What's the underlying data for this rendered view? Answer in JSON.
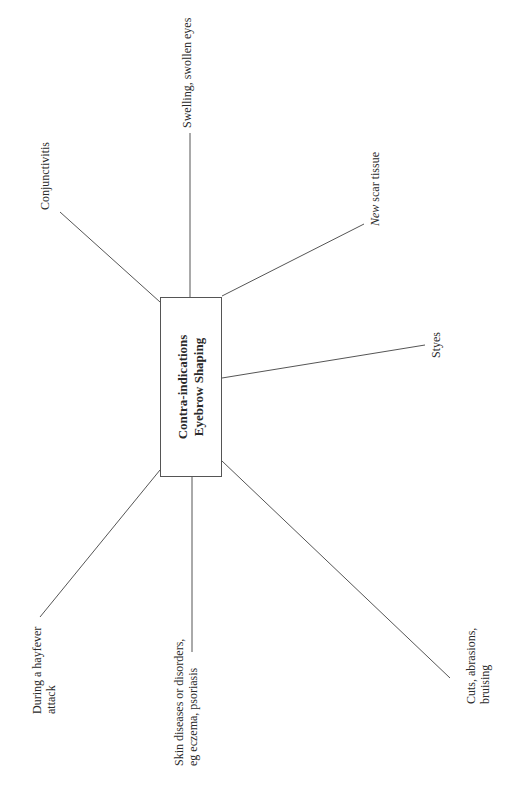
{
  "center": {
    "line1": "Contra-indications",
    "line2": "Eyebrow Shaping"
  },
  "branches": {
    "conjunctivitis": {
      "lines": [
        "Conjunctivitis"
      ]
    },
    "swelling": {
      "lines": [
        "Swelling, swollen eyes"
      ]
    },
    "new_scar": {
      "italic": "New",
      "rest": " scar tissue"
    },
    "styes": {
      "lines": [
        "Styes"
      ]
    },
    "cuts": {
      "lines": [
        "Cuts, abrasions,",
        "bruising"
      ]
    },
    "skin": {
      "lines": [
        "Skin diseases or disorders,",
        "eg eczema, psoriasis"
      ]
    },
    "hayfever": {
      "lines": [
        "During a hayfever",
        "attack"
      ]
    }
  },
  "colors": {
    "line": "#555555",
    "text": "#2a2a2a",
    "background": "#ffffff"
  }
}
